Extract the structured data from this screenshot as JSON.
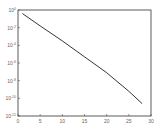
{
  "chart_data": {
    "type": "line",
    "title": "",
    "xlabel": "",
    "ylabel": "",
    "xlim": [
      0,
      30
    ],
    "ylim_log10": [
      -12,
      0
    ],
    "yscale": "log",
    "grid": false,
    "legend": null,
    "xticks": [
      "0",
      "5",
      "10",
      "15",
      "20",
      "25",
      "30"
    ],
    "yticks": [
      "10^0",
      "10^-2",
      "10^-4",
      "10^-6",
      "10^-8",
      "10^-10",
      "10^-12"
    ],
    "series": [
      {
        "name": "series-1",
        "color": "#000000",
        "x": [
          1,
          5,
          10,
          15,
          20,
          25,
          28
        ],
        "y_log10": [
          -0.4,
          -1.8,
          -3.5,
          -5.3,
          -7.1,
          -9.2,
          -10.6
        ]
      }
    ]
  }
}
